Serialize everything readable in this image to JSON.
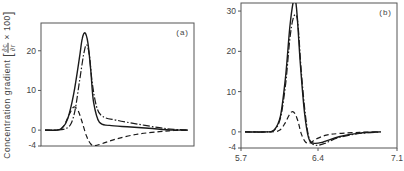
{
  "figure": {
    "ylabel_text": "Concentration gradient",
    "ylabel_fraction": {
      "num": "∂c",
      "den": "∂r"
    },
    "ylabel_suffix": "× 100",
    "ylabel_open": "[",
    "ylabel_close": "]"
  },
  "chart_data": [
    {
      "type": "line",
      "panel": "(a)",
      "title": "",
      "xlabel": "",
      "ylabel": "Concentration gradient [∂c/∂r × 100]",
      "yticks": [
        0,
        10,
        20
      ],
      "ytick_labels": [
        "0",
        "10",
        "20"
      ],
      "ylim": [
        -4,
        27
      ],
      "xticks": [],
      "xlim": [
        0,
        1
      ],
      "grid": false,
      "legend": null,
      "series": [
        {
          "name": "solid",
          "style": "solid",
          "x": [
            0.0,
            0.08,
            0.12,
            0.16,
            0.2,
            0.24,
            0.26,
            0.28,
            0.3,
            0.32,
            0.34,
            0.38,
            0.45,
            0.6,
            0.75,
            0.85,
            1.0
          ],
          "y": [
            0,
            0,
            0.5,
            3,
            9,
            18,
            23,
            24.5,
            22,
            15,
            7,
            2,
            1.2,
            0.8,
            0.4,
            0.1,
            0
          ]
        },
        {
          "name": "dash-dot",
          "style": "dashdot",
          "x": [
            0.0,
            0.08,
            0.14,
            0.18,
            0.21,
            0.24,
            0.27,
            0.29,
            0.31,
            0.33,
            0.36,
            0.4,
            0.5,
            0.65,
            0.8,
            0.9,
            1.0
          ],
          "y": [
            0,
            0,
            0.3,
            1.5,
            5,
            12,
            19,
            21.5,
            19,
            12,
            6,
            3.5,
            2.5,
            1.5,
            0.6,
            0.2,
            0
          ]
        },
        {
          "name": "dashed",
          "style": "dashed",
          "x": [
            0.0,
            0.08,
            0.13,
            0.17,
            0.2,
            0.23,
            0.26,
            0.29,
            0.32,
            0.35,
            0.4,
            0.5,
            0.65,
            0.8,
            0.9,
            1.0
          ],
          "y": [
            0,
            0,
            1,
            4,
            5.8,
            5,
            2,
            -1.5,
            -3.5,
            -3.9,
            -3.4,
            -2.2,
            -1.0,
            -0.4,
            -0.1,
            0
          ]
        }
      ],
      "annotations": [
        "(a)"
      ]
    },
    {
      "type": "line",
      "panel": "(b)",
      "title": "",
      "xlabel": "",
      "ylabel": "",
      "yticks": [
        0,
        10,
        20,
        30
      ],
      "ytick_labels": [
        "0",
        "10",
        "20",
        "30"
      ],
      "ylim": [
        -4,
        32
      ],
      "xticks": [
        5.7,
        6.4,
        7.1
      ],
      "xtick_labels": [
        "5.7",
        "6.4",
        "7.1"
      ],
      "xlim": [
        5.7,
        7.1
      ],
      "grid": false,
      "legend": null,
      "series": [
        {
          "name": "solid",
          "style": "solid",
          "x": [
            5.7,
            5.9,
            5.98,
            6.04,
            6.09,
            6.13,
            6.16,
            6.18,
            6.2,
            6.23,
            6.27,
            6.31,
            6.36,
            6.45,
            6.6,
            6.8,
            7.0
          ],
          "y": [
            0,
            0,
            0.5,
            4,
            14,
            26,
            32,
            33,
            29,
            17,
            5,
            -1.5,
            -2.8,
            -2.5,
            -1.2,
            -0.3,
            0
          ]
        },
        {
          "name": "dash-dot",
          "style": "dashdot",
          "x": [
            5.7,
            5.9,
            5.98,
            6.04,
            6.09,
            6.13,
            6.16,
            6.19,
            6.21,
            6.24,
            6.28,
            6.32,
            6.38,
            6.47,
            6.6,
            6.8,
            7.0
          ],
          "y": [
            0,
            0,
            0.4,
            3.5,
            12,
            23,
            28,
            29,
            26,
            15,
            4,
            -2,
            -3.3,
            -2.8,
            -1.4,
            -0.4,
            0
          ]
        },
        {
          "name": "dashed",
          "style": "dashed",
          "x": [
            5.7,
            5.95,
            6.03,
            6.08,
            6.12,
            6.15,
            6.18,
            6.21,
            6.24,
            6.28,
            6.32,
            6.38,
            6.48,
            6.6,
            6.8,
            7.0
          ],
          "y": [
            0,
            0,
            0.4,
            2,
            4,
            5,
            4.5,
            2.5,
            -0.5,
            -2.5,
            -2.8,
            -1.8,
            -0.8,
            -0.4,
            -0.1,
            0
          ]
        }
      ],
      "annotations": [
        "(b)"
      ]
    }
  ],
  "layout": {
    "panels": [
      {
        "left": 41,
        "top": 23,
        "right": 194,
        "bottom": 146
      },
      {
        "left": 241,
        "top": 3,
        "right": 397,
        "bottom": 148
      }
    ],
    "line_color": "#1a1a1a",
    "frame_color": "#555555",
    "text_color": "#444444"
  }
}
